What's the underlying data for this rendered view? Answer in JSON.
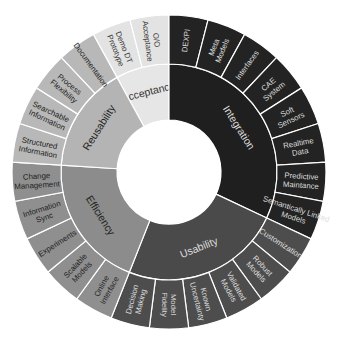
{
  "chart_data": {
    "type": "sunburst",
    "title": "",
    "center": [
      169,
      172
    ],
    "radii": {
      "inner": 52,
      "middle": 108,
      "outer": 157
    },
    "start_angle_deg": -28.8,
    "categories": [
      {
        "name": "Acceptance",
        "color": "#e6e6e6",
        "outer_color": "#e3e3e3",
        "text_color": "#333333",
        "children": [
          "Demo DT Prototype",
          "O/O Acceptance"
        ]
      },
      {
        "name": "Integration",
        "color": "#1f1f1f",
        "outer_color": "#232323",
        "text_color": "#dddddd",
        "children": [
          "DEXPI",
          "Meta Models",
          "Interfaces",
          "CAE System",
          "Soft Sensors",
          "Realtime Data",
          "Predictive Maintance",
          "Semantically Linked Models"
        ]
      },
      {
        "name": "Usability",
        "color": "#4a4a4a",
        "outer_color": "#4d4d4d",
        "text_color": "#dddddd",
        "children": [
          "Customization",
          "Robust Models",
          "Validated Models",
          "Known Uncertainty",
          "Model Fidelity",
          "Decision Making"
        ]
      },
      {
        "name": "Efficiency",
        "color": "#8c8c8c",
        "outer_color": "#8f8f8f",
        "text_color": "#222222",
        "children": [
          "Online Interface",
          "Scalable Models",
          "Experiments",
          "Information Sync",
          "Change Management"
        ]
      },
      {
        "name": "Reusability",
        "color": "#b4b4b4",
        "outer_color": "#b8b8b8",
        "text_color": "#222222",
        "children": [
          "Structured Information",
          "Searchable Information",
          "Process Flexibility",
          "Documentation"
        ]
      }
    ],
    "values_note": "Each leaf segment has equal weight (1); 25 leaves total"
  }
}
